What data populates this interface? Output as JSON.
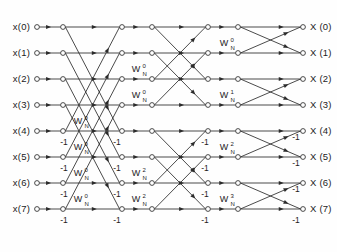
{
  "figure": {
    "type": "signal-flow-graph",
    "name": "8-point FFT butterfly flow graph",
    "stages": 3,
    "points": 8
  },
  "inputs": [
    {
      "label": "x(0)",
      "index": 0
    },
    {
      "label": "x(1)",
      "index": 1
    },
    {
      "label": "x(2)",
      "index": 2
    },
    {
      "label": "x(3)",
      "index": 3
    },
    {
      "label": "x(4)",
      "index": 4
    },
    {
      "label": "x(5)",
      "index": 5
    },
    {
      "label": "x(6)",
      "index": 6
    },
    {
      "label": "x(7)",
      "index": 7
    }
  ],
  "outputs": [
    {
      "label": "X (0)",
      "index": 0
    },
    {
      "label": "X (1)",
      "index": 1
    },
    {
      "label": "X (2)",
      "index": 2
    },
    {
      "label": "X (3)",
      "index": 3
    },
    {
      "label": "X (4)",
      "index": 4
    },
    {
      "label": "X (5)",
      "index": 5
    },
    {
      "label": "X (6)",
      "index": 6
    },
    {
      "label": "X (7)",
      "index": 7
    }
  ],
  "twiddle_base": "W",
  "twiddle_subscript": "N",
  "twiddle_labels": [
    {
      "id": "s1-r4",
      "exponent": "0",
      "x": 78,
      "y": 124,
      "stage": 1,
      "row": 4
    },
    {
      "id": "s1-r5",
      "exponent": "0",
      "x": 78,
      "y": 150,
      "stage": 1,
      "row": 5
    },
    {
      "id": "s1-r6",
      "exponent": "0",
      "x": 78,
      "y": 176,
      "stage": 1,
      "row": 6
    },
    {
      "id": "s1-r7",
      "exponent": "0",
      "x": 78,
      "y": 202,
      "stage": 1,
      "row": 7
    },
    {
      "id": "s2-r2",
      "exponent": "0",
      "x": 136,
      "y": 72,
      "stage": 2,
      "row": 2
    },
    {
      "id": "s2-r3",
      "exponent": "0",
      "x": 136,
      "y": 98,
      "stage": 2,
      "row": 3
    },
    {
      "id": "s2-r6",
      "exponent": "2",
      "x": 136,
      "y": 176,
      "stage": 2,
      "row": 6
    },
    {
      "id": "s2-r7",
      "exponent": "2",
      "x": 136,
      "y": 202,
      "stage": 2,
      "row": 7
    },
    {
      "id": "s3-r1",
      "exponent": "0",
      "x": 224,
      "y": 46,
      "stage": 3,
      "row": 1
    },
    {
      "id": "s3-r3",
      "exponent": "1",
      "x": 224,
      "y": 98,
      "stage": 3,
      "row": 3
    },
    {
      "id": "s3-r5",
      "exponent": "2",
      "x": 224,
      "y": 150,
      "stage": 3,
      "row": 5
    },
    {
      "id": "s3-r7",
      "exponent": "3",
      "x": 224,
      "y": 202,
      "stage": 3,
      "row": 7
    }
  ],
  "minus_one_labels": [
    {
      "id": "s1-r4",
      "text": "-1",
      "x": 64,
      "y": 145
    },
    {
      "id": "s1-r5",
      "text": "-1",
      "x": 64,
      "y": 171
    },
    {
      "id": "s1-r6",
      "text": "-1",
      "x": 64,
      "y": 197
    },
    {
      "id": "s1-r7",
      "text": "-1",
      "x": 64,
      "y": 223
    },
    {
      "id": "s2-r2",
      "text": "-1",
      "x": 117,
      "y": 145
    },
    {
      "id": "s2-r3",
      "text": "-1",
      "x": 117,
      "y": 171
    },
    {
      "id": "s2-r6",
      "text": "-1",
      "x": 117,
      "y": 197
    },
    {
      "id": "s2-r7",
      "text": "-1",
      "x": 117,
      "y": 223
    },
    {
      "id": "s3-r1",
      "text": "-1",
      "x": 205,
      "y": 145
    },
    {
      "id": "s3-r3",
      "text": "-1",
      "x": 205,
      "y": 171
    },
    {
      "id": "s3-r5",
      "text": "-1",
      "x": 205,
      "y": 197
    },
    {
      "id": "s3-r7",
      "text": "-1",
      "x": 205,
      "y": 223
    },
    {
      "id": "out-r4",
      "text": "-1",
      "x": 296,
      "y": 140
    },
    {
      "id": "out-r5",
      "text": "-1",
      "x": 296,
      "y": 166
    },
    {
      "id": "out-r6",
      "text": "-1",
      "x": 296,
      "y": 192
    },
    {
      "id": "out-r7",
      "text": "-1",
      "x": 296,
      "y": 223
    }
  ],
  "geometry": {
    "row_y": [
      27,
      53,
      79,
      105,
      131,
      157,
      183,
      209
    ],
    "columns": {
      "input_node": 37,
      "stage1_out": 63,
      "stage2_in": 122,
      "stage2_out": 152,
      "stage3_in": 208,
      "stage3_out": 238,
      "output_node": 303
    },
    "node_radius": 2.4
  },
  "colors": {
    "ink": "#2b2b2b",
    "background": "#fefefe",
    "text": "#1c1c1c"
  }
}
